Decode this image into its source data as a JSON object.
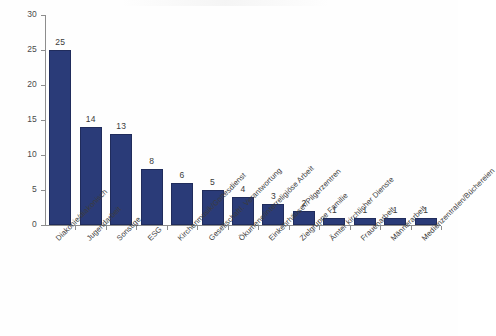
{
  "chart_data": {
    "type": "bar",
    "title": "",
    "subtitle": "",
    "xlabel": "",
    "ylabel": "",
    "ylim": [
      0,
      30
    ],
    "yticks": [
      0,
      5,
      10,
      15,
      20,
      25,
      30
    ],
    "ytick_labels": [
      "0",
      "5",
      "10",
      "15",
      "20",
      "25",
      "30"
    ],
    "grid": false,
    "legend": false,
    "legend_position": "none",
    "bar_color": "#2a3b78",
    "bar_edge_color": "#202c5c",
    "axis_color": "#8d8d8d",
    "label_color": "#3c3c3c",
    "data_labels_shown": true,
    "xtick_label_rotation": -45,
    "categories": [
      "Diakonie/diakonisch",
      "Jugendarbeit",
      "Sonstige",
      "ESG",
      "Kirchenmusik/Gottesdienst",
      "Gesellschaftl. Verantwortung",
      "Ökumene/interreligiöse Arbeit",
      "Einkehrhäuser/Pilgerzentren",
      "Zielgruppe Familie",
      "Ämter kirchlicher Dienste",
      "Frauenarbeit",
      "Männerarbeit",
      "Medienzentralen/Büchereien"
    ],
    "values": [
      25,
      14,
      13,
      8,
      6,
      5,
      4,
      3,
      2,
      1,
      1,
      1,
      1
    ],
    "value_labels": [
      "25",
      "14",
      "13",
      "8",
      "6",
      "5",
      "4",
      "3",
      "2",
      "1",
      "1",
      "1",
      "1"
    ]
  }
}
